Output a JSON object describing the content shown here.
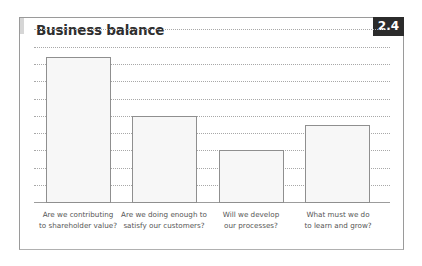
{
  "header": {
    "title": "Business balance",
    "figure_number": "2.4"
  },
  "chart_data": {
    "type": "bar",
    "title": "Business balance",
    "figure_number": "2.4",
    "categories": [
      "Are we contributing to shareholder value?",
      "Are we doing enough to satisfy our customers?",
      "Will we develop our processes?",
      "What must we do to learn and grow?"
    ],
    "category_lines": [
      [
        "Are we contributing",
        "to shareholder value?"
      ],
      [
        "Are we doing enough to",
        "satisfy our customers?"
      ],
      [
        "Will we develop",
        "our processes?"
      ],
      [
        "What must we do",
        "to learn and grow?"
      ]
    ],
    "values": [
      8.4,
      5.0,
      3.0,
      4.5
    ],
    "xlabel": "",
    "ylabel": "",
    "ylim": [
      0,
      9
    ],
    "yticks_labeled": false,
    "grid": true,
    "grid_style": "dotted horizontal",
    "legend": null,
    "colors": {
      "bar_fill": "#f7f7f7",
      "bar_border": "#8f8f8f",
      "badge_bg": "#2b2b2b"
    }
  },
  "labels": {
    "c0": "Are we contributing\nto shareholder value?",
    "c1": "Are we doing enough to\nsatisfy our customers?",
    "c2": "Will we develop\nour processes?",
    "c3": "What must we do\nto learn and grow?"
  }
}
